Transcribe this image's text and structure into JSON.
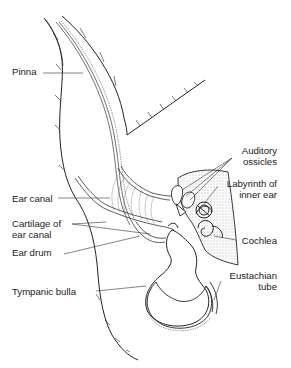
{
  "diagram": {
    "labels": {
      "pinna": "Pinna",
      "ear_canal": "Ear canal",
      "cartilage_line1": "Cartilage of",
      "cartilage_line2": "ear canal",
      "ear_drum": "Ear drum",
      "tympanic_bulla": "Tympanic bulla",
      "auditory_line1": "Auditory",
      "auditory_line2": "ossicles",
      "labyrinth_line1": "Labyrinth of",
      "labyrinth_line2": "inner ear",
      "cochlea": "Cochlea",
      "eustachian_line1": "Eustachian",
      "eustachian_line2": "tube"
    }
  }
}
